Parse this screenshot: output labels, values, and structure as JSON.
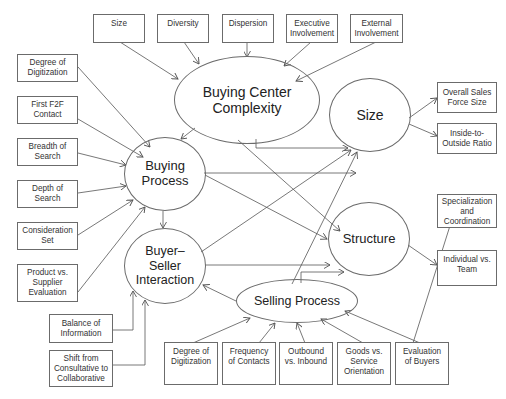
{
  "diagram": {
    "constructs": {
      "buying_center_complexity": "Buying Center\nComplexity",
      "buying_process": "Buying\nProcess",
      "buyer_seller_interaction": "Buyer–\nSeller\nInteraction",
      "selling_process": "Selling Process",
      "size": "Size",
      "structure": "Structure"
    },
    "top_boxes": [
      "Size",
      "Diversity",
      "Dispersion",
      "Executive\nInvolvement",
      "External\nInvolvement"
    ],
    "left_boxes": [
      "Degree of\nDigitization",
      "First F2F\nContact",
      "Breadth of\nSearch",
      "Depth of\nSearch",
      "Consideration\nSet",
      "Product vs.\nSupplier\nEvaluation"
    ],
    "lower_left_boxes": [
      "Balance of\nInformation",
      "Shift from\nConsultative to\nCollaborative"
    ],
    "bottom_boxes": [
      "Degree of\nDigitization",
      "Frequency\nof Contacts",
      "Outbound\nvs. Inbound",
      "Goods vs.\nService\nOrientation",
      "Evaluation\nof Buyers"
    ],
    "right_boxes": [
      "Overall Sales\nForce Size",
      "Inside-to-\nOutside Ratio",
      "Specialization\nand\nCoordination",
      "Individual vs.\nTeam"
    ],
    "colors": {
      "line": "#555555",
      "border": "#6b6b6b",
      "text": "#333333",
      "background": "#ffffff"
    }
  }
}
